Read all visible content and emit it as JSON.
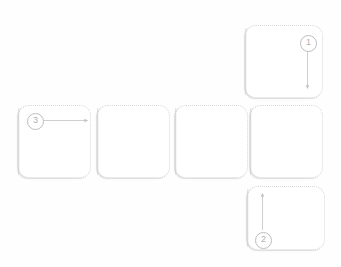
{
  "diagram": {
    "background_color": "#fefefe",
    "card_fill": "#ffffff",
    "card_border_color": "#d8d8d8",
    "annotation_color": "#b0b0b0",
    "cards": [
      {
        "id": "card-top-right",
        "label": "",
        "x": 245,
        "y": 25,
        "w": 78,
        "h": 73
      },
      {
        "id": "card-row-1",
        "label": "",
        "x": 18,
        "y": 105,
        "w": 73,
        "h": 73
      },
      {
        "id": "card-row-2",
        "label": "",
        "x": 97,
        "y": 105,
        "w": 73,
        "h": 73
      },
      {
        "id": "card-row-3",
        "label": "",
        "x": 175,
        "y": 105,
        "w": 73,
        "h": 73
      },
      {
        "id": "card-row-4",
        "label": "",
        "x": 250,
        "y": 105,
        "w": 73,
        "h": 73
      },
      {
        "id": "card-bottom-right",
        "label": "",
        "x": 247,
        "y": 186,
        "w": 78,
        "h": 64
      }
    ],
    "markers": [
      {
        "id": "marker-1",
        "label": "1",
        "x": 300,
        "y": 35,
        "arrow": "down",
        "arrow_length": 50
      },
      {
        "id": "marker-2",
        "label": "2",
        "x": 255,
        "y": 232,
        "arrow": "up",
        "arrow_length": 43
      },
      {
        "id": "marker-3",
        "label": "3",
        "x": 27,
        "y": 113,
        "arrow": "right",
        "arrow_length": 60
      }
    ]
  }
}
